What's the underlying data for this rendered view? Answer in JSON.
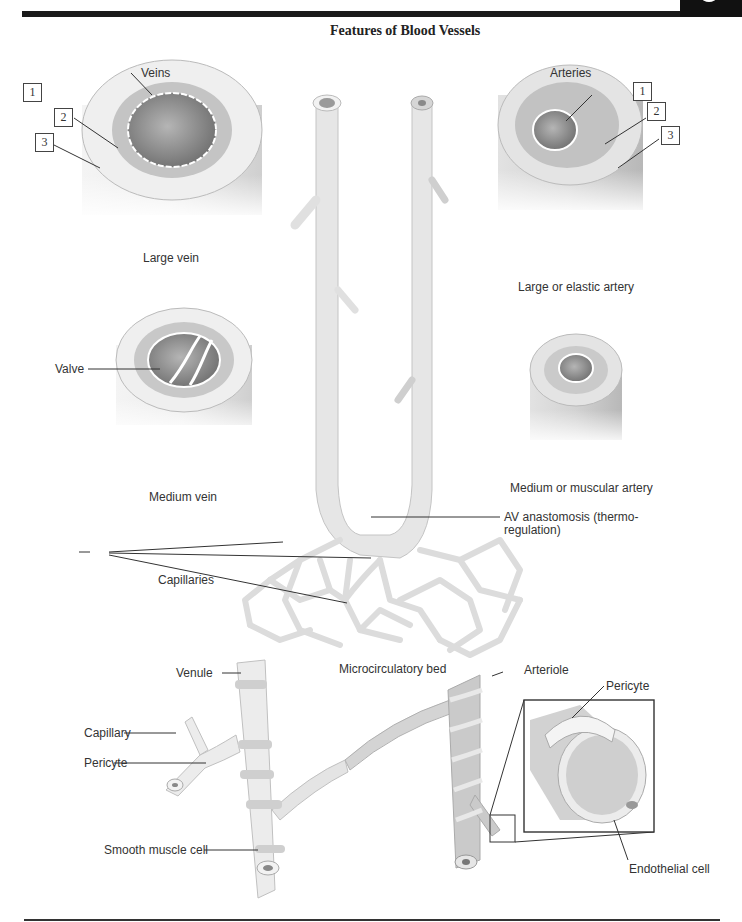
{
  "title": "Features of Blood Vessels",
  "columns": {
    "left": "Veins",
    "right": "Arteries"
  },
  "vessels": {
    "large_vein": "Large vein",
    "medium_vein": "Medium vein",
    "large_artery": "Large or elastic artery",
    "medium_artery": "Medium or muscular artery"
  },
  "layer_markers": [
    "1",
    "2",
    "3"
  ],
  "labels": {
    "valve": "Valve",
    "av_anastomosis_line1": "AV anastomosis (thermo-",
    "av_anastomosis_line2": "regulation)",
    "capillaries": "Capillaries",
    "microcirculatory_bed": "Microcirculatory bed",
    "venule": "Venule",
    "capillary": "Capillary",
    "pericyte_left": "Pericyte",
    "smooth_muscle_cell": "Smooth muscle cell",
    "arteriole": "Arteriole",
    "pericyte_inset": "Pericyte",
    "endothelial_cell": "Endothelial cell"
  },
  "colors": {
    "vein_fill": "#ececec",
    "artery_fill": "#d9d9d9",
    "media_ring": "#c9c9c9",
    "lumen": "#8a8a8a",
    "rule": "#1a1a1a"
  }
}
